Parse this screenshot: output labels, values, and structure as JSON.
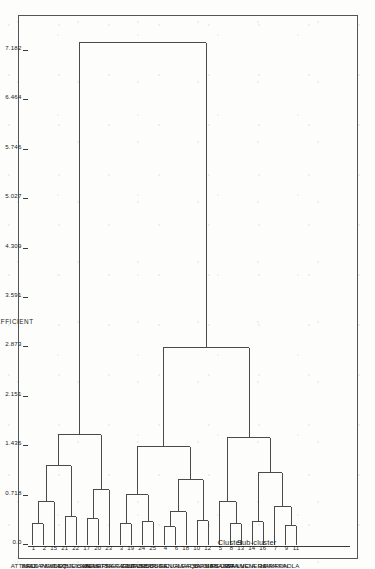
{
  "figure": {
    "headers": {
      "cluster": "Cluster",
      "subcluster": "Sub-cluster"
    },
    "axis_title": "COEFFICIENT"
  },
  "chart_data": {
    "type": "dendrogram",
    "title": "",
    "xlabel": "COEFFICIENT",
    "ylabel": "",
    "orientation": "horizontal-rotated",
    "xlim": [
      0.0,
      7.182
    ],
    "grid": false,
    "legend": "none",
    "tick_labels": [
      "0.0",
      "0.718",
      "1.436",
      "2.151",
      "2.873",
      "3.591",
      "4.309",
      "5.027",
      "5.746",
      "6.464",
      "7.182"
    ],
    "tick_values": [
      0.0,
      0.718,
      1.436,
      2.151,
      2.873,
      3.591,
      4.309,
      5.027,
      5.746,
      6.464,
      7.182
    ],
    "leaves": [
      {
        "id": 1,
        "label": "ATTARD",
        "subcluster": "A1",
        "cluster": "A"
      },
      {
        "id": 2,
        "label": "BALZAN",
        "subcluster": "A1",
        "cluster": "A"
      },
      {
        "id": 15,
        "label": "SAN PAWL",
        "subcluster": "A1",
        "cluster": "A"
      },
      {
        "id": 21,
        "label": "SWIEQI",
        "subcluster": "A1",
        "cluster": "A"
      },
      {
        "id": 22,
        "label": "TAXBIEX",
        "subcluster": "A1",
        "cluster": "A"
      },
      {
        "id": 17,
        "label": "ST JULIAN",
        "subcluster": "A2",
        "cluster": "A"
      },
      {
        "id": 20,
        "label": "SLIEMA",
        "subcluster": "A2",
        "cluster": "A"
      },
      {
        "id": 23,
        "label": "VALLETTA",
        "subcluster": "A2",
        "cluster": "A"
      },
      {
        "id": 3,
        "label": "BIRKIRKARA",
        "subcluster": "B1",
        "cluster": "B"
      },
      {
        "id": 19,
        "label": "SIGGIEWI",
        "subcluster": "B1",
        "cluster": "B"
      },
      {
        "id": 24,
        "label": "ZEJTUN",
        "subcluster": "B2",
        "cluster": "B"
      },
      {
        "id": 25,
        "label": "ZABBAR",
        "subcluster": "B2",
        "cluster": "B"
      },
      {
        "id": 4,
        "label": "BIRZEBBUGA",
        "subcluster": "B3",
        "cluster": "B"
      },
      {
        "id": 6,
        "label": "COSPICUA",
        "subcluster": "B3",
        "cluster": "B"
      },
      {
        "id": 18,
        "label": "SENGLEA",
        "subcluster": "B3",
        "cluster": "B"
      },
      {
        "id": 10,
        "label": "MARSA",
        "subcluster": "B4",
        "cluster": "B"
      },
      {
        "id": 12,
        "label": "QORMI",
        "subcluster": "B4",
        "cluster": "B"
      },
      {
        "id": 5,
        "label": "BUGIBBA",
        "subcluster": "C1",
        "cluster": "C"
      },
      {
        "id": 8,
        "label": "FGURA",
        "subcluster": "C2",
        "cluster": "C"
      },
      {
        "id": 13,
        "label": "SAN GWANN",
        "subcluster": "C2",
        "cluster": "C"
      },
      {
        "id": 14,
        "label": "STA LUCIA",
        "subcluster": "C3",
        "cluster": "C"
      },
      {
        "id": 16,
        "label": "STA VENERA",
        "subcluster": "C3",
        "cluster": "C"
      },
      {
        "id": 7,
        "label": "GZIRA",
        "subcluster": "C4",
        "cluster": "C"
      },
      {
        "id": 9,
        "label": "HAMRUN",
        "subcluster": "C4",
        "cluster": "C"
      },
      {
        "id": 11,
        "label": "PAOLA",
        "subcluster": "C4",
        "cluster": "C"
      }
    ],
    "subclusters": [
      {
        "name": "A1",
        "first": 0,
        "last": 4
      },
      {
        "name": "A2",
        "first": 5,
        "last": 7
      },
      {
        "name": "B1",
        "first": 8,
        "last": 9
      },
      {
        "name": "B2",
        "first": 10,
        "last": 11
      },
      {
        "name": "B3",
        "first": 12,
        "last": 14
      },
      {
        "name": "B4",
        "first": 15,
        "last": 16
      },
      {
        "name": "C1",
        "first": 17,
        "last": 17
      },
      {
        "name": "C2",
        "first": 18,
        "last": 19
      },
      {
        "name": "C3",
        "first": 20,
        "last": 21
      },
      {
        "name": "C4",
        "first": 22,
        "last": 24
      }
    ],
    "clusters": [
      {
        "name": "A",
        "first": 0,
        "last": 7
      },
      {
        "name": "B",
        "first": 8,
        "last": 16
      },
      {
        "name": "C",
        "first": 17,
        "last": 24
      }
    ],
    "merges": [
      {
        "left": {
          "leaf": 0
        },
        "right": {
          "leaf": 1
        },
        "height": 0.3
      },
      {
        "left": {
          "node": 0
        },
        "right": {
          "leaf": 2
        },
        "height": 0.62
      },
      {
        "left": {
          "leaf": 3
        },
        "right": {
          "leaf": 4
        },
        "height": 0.4
      },
      {
        "left": {
          "node": 1
        },
        "right": {
          "node": 2
        },
        "height": 1.15
      },
      {
        "left": {
          "leaf": 5
        },
        "right": {
          "leaf": 6
        },
        "height": 0.38
      },
      {
        "left": {
          "node": 4
        },
        "right": {
          "leaf": 7
        },
        "height": 0.8
      },
      {
        "left": {
          "node": 3
        },
        "right": {
          "node": 5
        },
        "height": 1.6
      },
      {
        "left": {
          "leaf": 8
        },
        "right": {
          "leaf": 9
        },
        "height": 0.3
      },
      {
        "left": {
          "leaf": 10
        },
        "right": {
          "leaf": 11
        },
        "height": 0.33
      },
      {
        "left": {
          "node": 7
        },
        "right": {
          "node": 8
        },
        "height": 0.72
      },
      {
        "left": {
          "leaf": 12
        },
        "right": {
          "leaf": 13
        },
        "height": 0.26
      },
      {
        "left": {
          "node": 10
        },
        "right": {
          "leaf": 14
        },
        "height": 0.48
      },
      {
        "left": {
          "leaf": 15
        },
        "right": {
          "leaf": 16
        },
        "height": 0.35
      },
      {
        "left": {
          "node": 11
        },
        "right": {
          "node": 12
        },
        "height": 0.95
      },
      {
        "left": {
          "node": 9
        },
        "right": {
          "node": 13
        },
        "height": 1.42
      },
      {
        "left": {
          "leaf": 18
        },
        "right": {
          "leaf": 19
        },
        "height": 0.3
      },
      {
        "left": {
          "leaf": 17
        },
        "right": {
          "node": 15
        },
        "height": 0.62
      },
      {
        "left": {
          "leaf": 20
        },
        "right": {
          "leaf": 21
        },
        "height": 0.33
      },
      {
        "left": {
          "leaf": 23
        },
        "right": {
          "leaf": 24
        },
        "height": 0.28
      },
      {
        "left": {
          "leaf": 22
        },
        "right": {
          "node": 18
        },
        "height": 0.55
      },
      {
        "left": {
          "node": 17
        },
        "right": {
          "node": 19
        },
        "height": 1.05
      },
      {
        "left": {
          "node": 16
        },
        "right": {
          "node": 20
        },
        "height": 1.55
      },
      {
        "left": {
          "node": 14
        },
        "right": {
          "node": 21
        },
        "height": 2.87
      },
      {
        "left": {
          "node": 6
        },
        "right": {
          "node": 22
        },
        "height": 7.3
      }
    ]
  }
}
